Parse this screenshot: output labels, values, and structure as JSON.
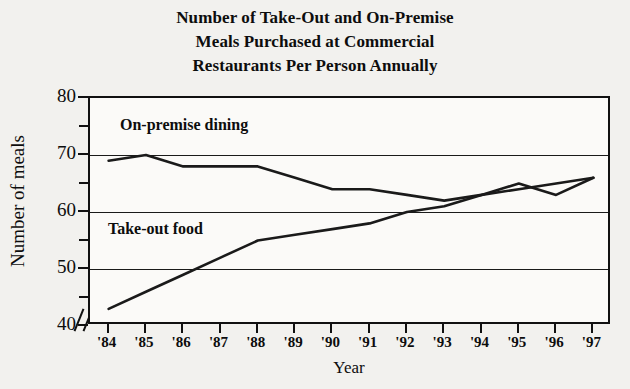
{
  "title": {
    "line1": "Number of Take-Out and On-Premise",
    "line2": "Meals Purchased at Commercial",
    "line3": "Restaurants Per Person Annually"
  },
  "axes": {
    "ylabel": "Number of meals",
    "xlabel": "Year",
    "y_ticks_major": [
      "40",
      "50",
      "60",
      "70",
      "80"
    ],
    "y_ticks_minor": [
      "45",
      "55",
      "65",
      "75"
    ],
    "axis_break_symbol": "//"
  },
  "series_labels": {
    "on_premise": "On-premise dining",
    "take_out": "Take-out food"
  },
  "colors": {
    "line": "#1a1a1a",
    "grid": "#1a1a1a",
    "plot_background": "#fbfaf8",
    "page_background": "#f2f1ee",
    "text": "#0d0d0d"
  },
  "chart_data": {
    "type": "line",
    "title": "Number of Take-Out and On-Premise Meals Purchased at Commercial Restaurants Per Person Annually",
    "xlabel": "Year",
    "ylabel": "Number of meals",
    "categories": [
      "'84",
      "'85",
      "'86",
      "'87",
      "'88",
      "'89",
      "'90",
      "'91",
      "'92",
      "'93",
      "'94",
      "'95",
      "'96",
      "'97"
    ],
    "ylim": [
      40,
      80
    ],
    "y_axis_break": true,
    "grid": true,
    "legend_position": "inside-plot-labels",
    "series": [
      {
        "name": "On-premise dining",
        "values": [
          69,
          70,
          68,
          68,
          68,
          66,
          64,
          64,
          63,
          62,
          63,
          65,
          63,
          66
        ]
      },
      {
        "name": "Take-out food",
        "values": [
          43,
          46,
          49,
          52,
          55,
          56,
          57,
          58,
          60,
          61,
          63,
          64,
          65,
          66
        ]
      }
    ]
  }
}
